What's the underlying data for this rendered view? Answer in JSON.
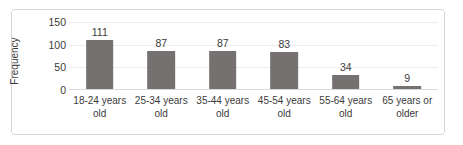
{
  "chart_data": {
    "type": "bar",
    "title": "",
    "subtitle": "",
    "xlabel": "",
    "ylabel": "Frequency",
    "categories": [
      "18-24 years old",
      "25-34 years old",
      "35-44 years old",
      "45-54 years old",
      "55-64 years old",
      "65 years or older"
    ],
    "values": [
      111,
      87,
      87,
      83,
      34,
      9
    ],
    "data_labels": [
      "111",
      "87",
      "87",
      "83",
      "34",
      "9"
    ],
    "ylim": [
      0,
      150
    ],
    "yticks": [
      0,
      50,
      100,
      150
    ],
    "ytick_labels": [
      "0",
      "50",
      "100",
      "150"
    ],
    "grid": true,
    "legend": false,
    "legend_position": "none",
    "colors": {
      "bar": "#767171",
      "gridline": "#ececec",
      "axis": "#d9d9d9",
      "text": "#3b3b3b",
      "frame_border": "#d6d6d6",
      "background": "#ffffff"
    }
  }
}
